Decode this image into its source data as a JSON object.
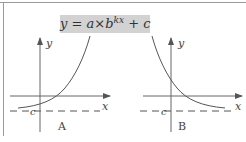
{
  "diagram": {
    "formula": {
      "lhs": "y",
      "eq": "=",
      "a": "a",
      "times": "×",
      "base": "b",
      "exponent": "kx",
      "plus": "+",
      "c": "c"
    },
    "graphs": [
      {
        "id": "A",
        "label": "A",
        "x_axis_label": "x",
        "y_axis_label": "y",
        "asymptote_label": "c",
        "curve": "increasing exponential, approaching asymptote y=c as x→−∞"
      },
      {
        "id": "B",
        "label": "B",
        "x_axis_label": "x",
        "y_axis_label": "y",
        "asymptote_label": "c",
        "curve": "decreasing exponential, approaching asymptote y=c as x→+∞"
      }
    ],
    "colors": {
      "formula_bg": "#d2d2d2",
      "line": "#555555",
      "frame": "#9a9a9a"
    }
  }
}
